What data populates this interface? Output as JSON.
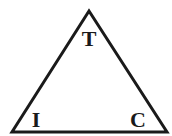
{
  "diagram": {
    "shape": "triangle",
    "stroke_color": "#1a1a1a",
    "vertices": {
      "top": {
        "label": "T"
      },
      "bottom_left": {
        "label": "I"
      },
      "bottom_right": {
        "label": "C"
      }
    }
  }
}
